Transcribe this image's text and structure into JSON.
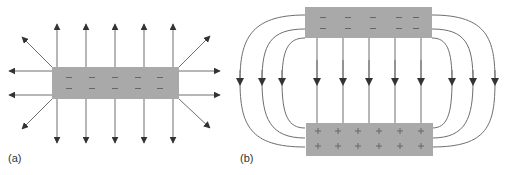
{
  "panels": [
    {
      "id": "a",
      "label": "(a)",
      "description": "Electric field lines radiating from a single negatively charged plate",
      "plate": {
        "charge": "negative",
        "sign": "−",
        "rows": 2,
        "cols": 5
      }
    },
    {
      "id": "b",
      "label": "(b)",
      "description": "Electric field between a negatively charged top plate and positively charged bottom plate",
      "top_plate": {
        "charge": "negative",
        "sign": "−",
        "rows": 2,
        "cols": 5
      },
      "bottom_plate": {
        "charge": "positive",
        "sign": "+",
        "rows": 2,
        "cols": 6
      }
    }
  ],
  "colors": {
    "plate_fill": "#a9a9a9",
    "charge_mark": "#666666",
    "field_line": "#6e6e6e",
    "arrowhead": "#333333",
    "label": "#333333"
  }
}
